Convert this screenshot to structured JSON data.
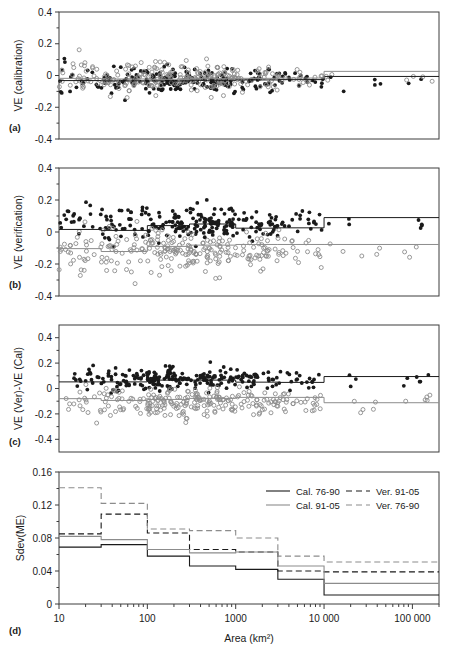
{
  "figure": {
    "panels": [
      {
        "id": "a",
        "label": "(a)",
        "ylabel": "VE (calibration)",
        "yticks": [
          "0.4",
          "0.2",
          "0",
          "-0.2",
          "-0.4"
        ]
      },
      {
        "id": "b",
        "label": "(b)",
        "ylabel": "VE (verification)",
        "yticks": [
          "0.4",
          "0.2",
          "0",
          "-0.2",
          "-0.4"
        ]
      },
      {
        "id": "c",
        "label": "(c)",
        "ylabel": "VE (Ver)-VE (Cal)",
        "yticks": [
          "0.4",
          "0.2",
          "0",
          "-0.2",
          "-0.4"
        ]
      },
      {
        "id": "d",
        "label": "(d)",
        "ylabel": "Sdev(ME)",
        "yticks": [
          "0.16",
          "0.12",
          "0.08",
          "0.04",
          "0"
        ]
      }
    ],
    "xlabel": "Area (km²)",
    "xticks": [
      "10",
      "100",
      "1000",
      "10 000",
      "100 000"
    ],
    "legend": [
      {
        "label": "Cal. 76-90",
        "style": "solid",
        "color": "#1a1a1a"
      },
      {
        "label": "Ver. 91-05",
        "style": "dashed",
        "color": "#1a1a1a"
      },
      {
        "label": "Cal. 91-05",
        "style": "solid",
        "color": "#8c8c8c"
      },
      {
        "label": "Ver. 76-90",
        "style": "dashed",
        "color": "#8c8c8c"
      }
    ]
  },
  "chart_data": [
    {
      "type": "scatter",
      "panel": "a",
      "title": "",
      "xlabel": "Area (km²)",
      "ylabel": "VE (calibration)",
      "xscale": "log",
      "xlim": [
        10,
        200000
      ],
      "ylim": [
        -0.4,
        0.4
      ],
      "grid": false,
      "series": [
        {
          "name": "Cal. 76-90",
          "marker": "filled-circle",
          "color": "#1a1a1a"
        },
        {
          "name": "Cal. 91-05",
          "marker": "open-circle",
          "color": "#8c8c8c"
        }
      ],
      "step_lines": [
        {
          "name": "Cal. 76-90",
          "color": "#1a1a1a",
          "style": "solid",
          "edges": [
            10,
            30,
            100,
            300,
            1000,
            3000,
            10000,
            200000
          ],
          "values": [
            -0.032,
            -0.034,
            -0.034,
            -0.03,
            -0.028,
            -0.026,
            -0.006,
            -0.006
          ]
        },
        {
          "name": "Cal. 91-05",
          "color": "#8c8c8c",
          "style": "solid",
          "edges": [
            10,
            30,
            100,
            300,
            1000,
            3000,
            10000,
            200000
          ],
          "values": [
            -0.018,
            -0.022,
            -0.024,
            -0.02,
            -0.018,
            -0.016,
            0.026,
            0.026
          ]
        }
      ]
    },
    {
      "type": "scatter",
      "panel": "b",
      "xlabel": "Area (km²)",
      "ylabel": "VE (verification)",
      "xscale": "log",
      "xlim": [
        10,
        200000
      ],
      "ylim": [
        -0.4,
        0.4
      ],
      "grid": false,
      "series": [
        {
          "name": "Ver. 91-05",
          "marker": "filled-circle",
          "color": "#1a1a1a"
        },
        {
          "name": "Ver. 76-90",
          "marker": "open-circle",
          "color": "#8c8c8c"
        }
      ],
      "step_lines": [
        {
          "name": "Ver. 91-05",
          "color": "#1a1a1a",
          "style": "solid",
          "edges": [
            10,
            30,
            100,
            300,
            1000,
            3000,
            10000,
            200000
          ],
          "values": [
            0.016,
            0.01,
            0.04,
            0.05,
            0.024,
            0.026,
            0.09,
            0.09
          ]
        },
        {
          "name": "Ver. 76-90",
          "color": "#8c8c8c",
          "style": "solid",
          "edges": [
            10,
            30,
            100,
            300,
            1000,
            3000,
            10000,
            200000
          ],
          "values": [
            -0.104,
            -0.122,
            -0.09,
            -0.082,
            -0.078,
            -0.078,
            -0.078,
            -0.078
          ]
        }
      ]
    },
    {
      "type": "scatter",
      "panel": "c",
      "xlabel": "Area (km²)",
      "ylabel": "VE (Ver)-VE (Cal)",
      "xscale": "log",
      "xlim": [
        10,
        200000
      ],
      "ylim": [
        -0.5,
        0.5
      ],
      "grid": false,
      "series": [
        {
          "name": "91-05 minus 76-90",
          "marker": "filled-circle",
          "color": "#1a1a1a"
        },
        {
          "name": "76-90 minus 91-05",
          "marker": "open-circle",
          "color": "#8c8c8c"
        }
      ],
      "step_lines": [
        {
          "name": "black-step",
          "color": "#1a1a1a",
          "style": "solid",
          "edges": [
            10,
            30,
            100,
            300,
            1000,
            3000,
            10000,
            200000
          ],
          "values": [
            0.052,
            0.052,
            0.066,
            0.066,
            0.05,
            0.048,
            0.094,
            0.094
          ]
        },
        {
          "name": "gray-step",
          "color": "#8c8c8c",
          "style": "solid",
          "edges": [
            10,
            30,
            100,
            300,
            1000,
            3000,
            10000,
            200000
          ],
          "values": [
            -0.08,
            -0.094,
            -0.086,
            -0.078,
            -0.07,
            -0.07,
            -0.112,
            -0.112
          ]
        }
      ]
    },
    {
      "type": "line",
      "panel": "d",
      "xlabel": "Area (km²)",
      "ylabel": "Sdev(ME)",
      "xscale": "log",
      "xlim": [
        10,
        200000
      ],
      "ylim": [
        0,
        0.16
      ],
      "grid": false,
      "drawstyle": "steps-post",
      "bin_edges": [
        10,
        30,
        100,
        300,
        1000,
        3000,
        10000,
        200000
      ],
      "series": [
        {
          "name": "Cal. 76-90",
          "style": "solid",
          "color": "#1a1a1a",
          "values": [
            0.069,
            0.072,
            0.058,
            0.046,
            0.042,
            0.03,
            0.011
          ]
        },
        {
          "name": "Ver. 91-05",
          "style": "dashed",
          "color": "#1a1a1a",
          "values": [
            0.085,
            0.109,
            0.086,
            0.066,
            0.063,
            0.04,
            0.039
          ]
        },
        {
          "name": "Cal. 91-05",
          "style": "solid",
          "color": "#8c8c8c",
          "values": [
            0.082,
            0.078,
            0.066,
            0.062,
            0.063,
            0.046,
            0.025
          ]
        },
        {
          "name": "Ver. 76-90",
          "style": "dashed",
          "color": "#8c8c8c",
          "values": [
            0.141,
            0.122,
            0.091,
            0.089,
            0.08,
            0.058,
            0.051
          ]
        }
      ]
    }
  ]
}
